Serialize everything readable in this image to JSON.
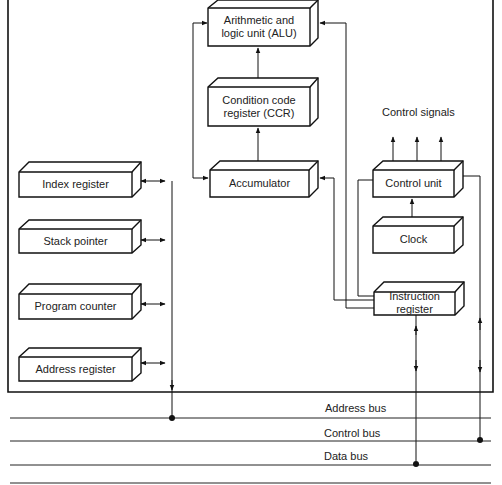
{
  "diagram": {
    "type": "microprocessor block diagram",
    "blocks": {
      "alu": {
        "label": "Arithmetic and\nlogic unit (ALU)",
        "line1": "Arithmetic and",
        "line2": "logic unit (ALU)"
      },
      "ccr": {
        "label": "Condition code\nregister (CCR)",
        "line1": "Condition code",
        "line2": "register (CCR)"
      },
      "accumulator": {
        "label": "Accumulator"
      },
      "control_unit": {
        "label": "Control unit"
      },
      "clock": {
        "label": "Clock"
      },
      "instruction_register": {
        "label": "Instruction\nregister",
        "line1": "Instruction",
        "line2": "register"
      },
      "index_register": {
        "label": "Index register"
      },
      "stack_pointer": {
        "label": "Stack pointer"
      },
      "program_counter": {
        "label": "Program counter"
      },
      "address_register": {
        "label": "Address register"
      }
    },
    "annotations": {
      "control_signals": "Control signals"
    },
    "buses": [
      {
        "name": "address_bus",
        "label": "Address bus"
      },
      {
        "name": "control_bus",
        "label": "Control bus"
      },
      {
        "name": "data_bus",
        "label": "Data bus"
      }
    ],
    "edges": [
      {
        "from": "ccr",
        "to": "alu"
      },
      {
        "from": "accumulator",
        "to": "ccr"
      },
      {
        "from": "alu",
        "to": "accumulator",
        "via": "left loop"
      },
      {
        "from": "instruction_register",
        "to": "alu"
      },
      {
        "from": "instruction_register",
        "to": "accumulator"
      },
      {
        "from": "clock",
        "to": "control_unit"
      },
      {
        "from": "control_unit",
        "to": "control_signals"
      },
      {
        "from": "instruction_register",
        "to": "control_unit"
      },
      {
        "from": "index_register",
        "to": "address_bus",
        "bidirectional": true
      },
      {
        "from": "stack_pointer",
        "to": "address_bus",
        "bidirectional": true
      },
      {
        "from": "program_counter",
        "to": "address_bus",
        "bidirectional": true
      },
      {
        "from": "address_register",
        "to": "address_bus",
        "bidirectional": true
      },
      {
        "from": "instruction_register",
        "to": "data_bus",
        "bidirectional": true
      },
      {
        "from": "control_unit",
        "to": "control_bus",
        "bidirectional": true
      }
    ]
  }
}
